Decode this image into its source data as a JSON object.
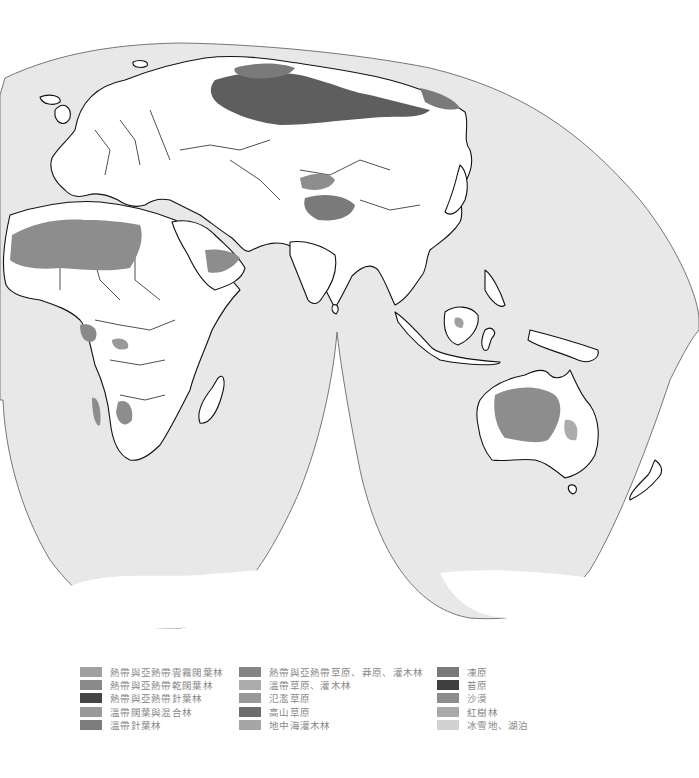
{
  "map": {
    "projection": "interrupted (Goode-style) world map — Eastern Hemisphere lobes",
    "regions_visible": [
      "Europe",
      "Africa",
      "Asia",
      "Australia",
      "New Zealand",
      "Antarctica (edge)"
    ]
  },
  "colors": {
    "ocean": "#e8e8e8",
    "land": "#ffffff",
    "outline": "#111111",
    "tropical_moist_forest": "#a0a0a0",
    "tropical_dry_forest": "#8a8a8a",
    "tropical_conifer_forest": "#454545",
    "temperate_mixed_forest": "#9a9a9a",
    "temperate_conifer_forest": "#7c7c7c",
    "tropical_grassland": "#858585",
    "temperate_grassland": "#acacac",
    "flooded_grassland": "#999999",
    "montane_grassland": "#6e6e6e",
    "mediterranean_scrub": "#a6a6a6",
    "tundra": "#7a7a7a",
    "moss_tundra": "#3f3f3f",
    "desert": "#8d8d8d",
    "mangrove": "#aaaaaa",
    "ice_lake": "#d2d2d2"
  },
  "legend": {
    "columns": [
      {
        "items": [
          {
            "label": "熱帶與亞熱帶雲霧闊葉林",
            "color": "#a0a0a0"
          },
          {
            "label": "熱帶與亞熱帶乾闊葉林",
            "color": "#8a8a8a"
          },
          {
            "label": "熱帶與亞熱帶針葉林",
            "color": "#454545"
          },
          {
            "label": "溫帶闊葉與混合林",
            "color": "#9a9a9a"
          },
          {
            "label": "溫帶針葉林",
            "color": "#7c7c7c"
          }
        ]
      },
      {
        "items": [
          {
            "label": "熱帶與亞熱帶草原、莽原、灌木林",
            "color": "#858585"
          },
          {
            "label": "溫帶草原、灌木林",
            "color": "#acacac"
          },
          {
            "label": "氾濫草原",
            "color": "#999999"
          },
          {
            "label": "高山草原",
            "color": "#6e6e6e"
          },
          {
            "label": "地中海灌木林",
            "color": "#a6a6a6"
          }
        ]
      },
      {
        "items": [
          {
            "label": "凍原",
            "color": "#7a7a7a"
          },
          {
            "label": "苔原",
            "color": "#3f3f3f"
          },
          {
            "label": "沙漠",
            "color": "#8d8d8d"
          },
          {
            "label": "紅樹林",
            "color": "#aaaaaa"
          },
          {
            "label": "冰雪地、湖泊",
            "color": "#d2d2d2"
          }
        ]
      }
    ]
  }
}
